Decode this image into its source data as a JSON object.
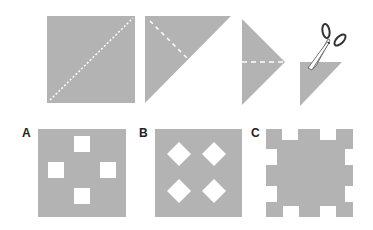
{
  "colors": {
    "paper": "#b3b3b3",
    "hole": "#ffffff",
    "fold_line": "#ffffff",
    "label": "#222222",
    "scissors_handle": "#333333"
  },
  "folding_steps": [
    {
      "step": 1,
      "shape": "square",
      "fold_line": "diagonal bottom-left to top-right"
    },
    {
      "step": 2,
      "shape": "right triangle",
      "fold_line": "from top-left corner toward hypotenuse midpoint"
    },
    {
      "step": 3,
      "shape": "triangle pointing right",
      "fold_line": "horizontal through middle"
    },
    {
      "step": 4,
      "shape": "small right triangle",
      "action": "cut corner with scissors"
    }
  ],
  "options": [
    {
      "label": "A",
      "pattern": "four squares holes in plus arrangement"
    },
    {
      "label": "B",
      "pattern": "four diamond holes in 2x2 grid"
    },
    {
      "label": "C",
      "pattern": "square notches cut along all edges"
    }
  ]
}
